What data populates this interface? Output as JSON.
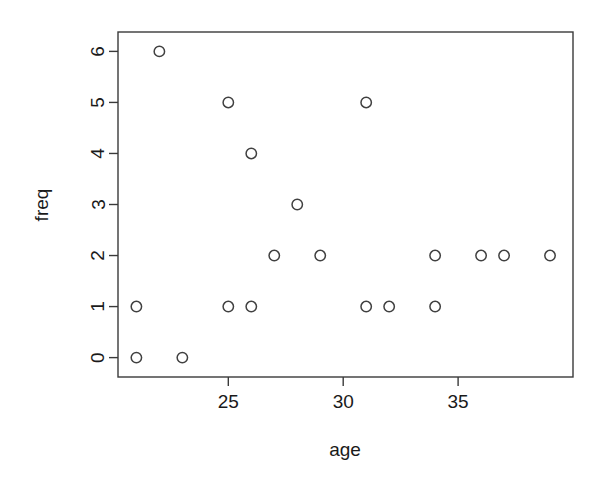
{
  "chart_data": {
    "type": "scatter",
    "title": "",
    "subtitle": "",
    "xlabel": "age",
    "ylabel": "freq",
    "grid": false,
    "legend": null,
    "legend_position": "none",
    "marker": "open-circle",
    "marker_color": "#404040",
    "background_color": "#ffffff",
    "frame": true,
    "xlim": [
      20.2,
      40.0
    ],
    "ylim": [
      -0.38,
      6.38
    ],
    "xticks": [
      25,
      30,
      35
    ],
    "xtick_labels": [
      "25",
      "30",
      "35"
    ],
    "yticks": [
      0,
      1,
      2,
      3,
      4,
      5,
      6
    ],
    "ytick_labels": [
      "0",
      "1",
      "2",
      "3",
      "4",
      "5",
      "6"
    ],
    "x": [
      21,
      23,
      21,
      25,
      26,
      31,
      32,
      34,
      27,
      29,
      34,
      36,
      37,
      39,
      28,
      26,
      25,
      31,
      22
    ],
    "y": [
      0,
      0,
      1,
      1,
      1,
      1,
      1,
      1,
      2,
      2,
      2,
      2,
      2,
      2,
      3,
      4,
      5,
      5,
      6
    ],
    "points": [
      {
        "age": 21,
        "freq": 0
      },
      {
        "age": 23,
        "freq": 0
      },
      {
        "age": 21,
        "freq": 1
      },
      {
        "age": 25,
        "freq": 1
      },
      {
        "age": 26,
        "freq": 1
      },
      {
        "age": 31,
        "freq": 1
      },
      {
        "age": 32,
        "freq": 1
      },
      {
        "age": 34,
        "freq": 1
      },
      {
        "age": 27,
        "freq": 2
      },
      {
        "age": 29,
        "freq": 2
      },
      {
        "age": 34,
        "freq": 2
      },
      {
        "age": 36,
        "freq": 2
      },
      {
        "age": 37,
        "freq": 2
      },
      {
        "age": 39,
        "freq": 2
      },
      {
        "age": 28,
        "freq": 3
      },
      {
        "age": 26,
        "freq": 4
      },
      {
        "age": 25,
        "freq": 5
      },
      {
        "age": 31,
        "freq": 5
      },
      {
        "age": 22,
        "freq": 6
      }
    ]
  }
}
